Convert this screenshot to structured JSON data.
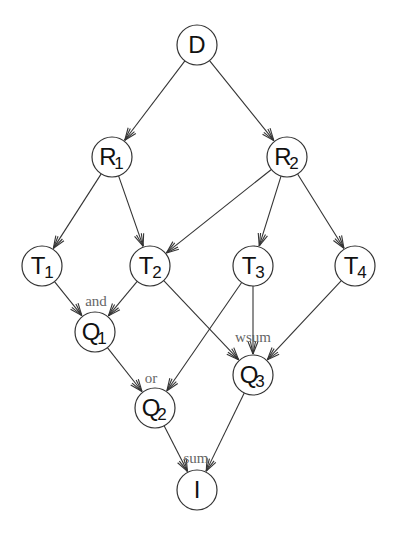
{
  "diagram": {
    "nodes": [
      {
        "id": "D",
        "label": "D",
        "sub": "",
        "x": 197,
        "y": 45
      },
      {
        "id": "R1",
        "label": "R",
        "sub": "1",
        "x": 112,
        "y": 157
      },
      {
        "id": "R2",
        "label": "R",
        "sub": "2",
        "x": 287,
        "y": 157
      },
      {
        "id": "T1",
        "label": "T",
        "sub": "1",
        "x": 42,
        "y": 266
      },
      {
        "id": "T2",
        "label": "T",
        "sub": "2",
        "x": 150,
        "y": 266
      },
      {
        "id": "T3",
        "label": "T",
        "sub": "3",
        "x": 253,
        "y": 266
      },
      {
        "id": "T4",
        "label": "T",
        "sub": "4",
        "x": 355,
        "y": 266
      },
      {
        "id": "Q1",
        "label": "Q",
        "sub": "1",
        "x": 95,
        "y": 332
      },
      {
        "id": "Q2",
        "label": "Q",
        "sub": "2",
        "x": 155,
        "y": 408
      },
      {
        "id": "Q3",
        "label": "Q",
        "sub": "3",
        "x": 253,
        "y": 375
      },
      {
        "id": "I",
        "label": "I",
        "sub": "",
        "x": 197,
        "y": 490
      }
    ],
    "edges": [
      {
        "from": "D",
        "to": "R1"
      },
      {
        "from": "D",
        "to": "R2"
      },
      {
        "from": "R1",
        "to": "T1"
      },
      {
        "from": "R1",
        "to": "T2"
      },
      {
        "from": "R2",
        "to": "T2"
      },
      {
        "from": "R2",
        "to": "T3"
      },
      {
        "from": "R2",
        "to": "T4"
      },
      {
        "from": "T1",
        "to": "Q1"
      },
      {
        "from": "T2",
        "to": "Q1"
      },
      {
        "from": "T2",
        "to": "Q3"
      },
      {
        "from": "T3",
        "to": "Q2"
      },
      {
        "from": "T3",
        "to": "Q3"
      },
      {
        "from": "T4",
        "to": "Q3"
      },
      {
        "from": "Q1",
        "to": "Q2"
      },
      {
        "from": "Q2",
        "to": "I"
      },
      {
        "from": "Q3",
        "to": "I"
      }
    ],
    "operator_labels": [
      {
        "text": "and",
        "node": "Q1",
        "x": 96,
        "y": 306
      },
      {
        "text": "wsum",
        "node": "Q3",
        "x": 253,
        "y": 342
      },
      {
        "text": "or",
        "node": "Q2",
        "x": 151,
        "y": 383
      },
      {
        "text": "sum",
        "node": "I",
        "x": 196,
        "y": 463
      }
    ],
    "node_radius": 20
  }
}
